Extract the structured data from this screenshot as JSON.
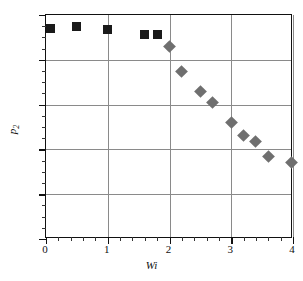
{
  "chart_data": {
    "type": "scatter",
    "title": "",
    "xlabel": "Wi",
    "ylabel": "p2",
    "ylabel_base": "p",
    "ylabel_sub": "2",
    "xlim": [
      0,
      4
    ],
    "ylim": [
      0,
      1.0
    ],
    "xticks": [
      0,
      1,
      2,
      3,
      4
    ],
    "xtick_labels": [
      "0",
      "1",
      "2",
      "3",
      "4"
    ],
    "yticks": [
      0,
      0.2,
      0.4,
      0.6,
      0.8,
      1.0
    ],
    "ytick_labels": [
      "0",
      "0.2",
      "0.4",
      "0.6",
      "0.8",
      "1.0"
    ],
    "x_minor_interval": 0.2,
    "y_minor_interval": 0.05,
    "grid": "horizontal-and-vertical-major",
    "grid_color": "#8a8a8a",
    "frame_color": "#111111",
    "background": "#ffffff",
    "legend": "none",
    "series": [
      {
        "name": "squares",
        "marker": "square",
        "color": "#1a1a1a",
        "points": [
          {
            "x": 0.08,
            "y": 0.94
          },
          {
            "x": 0.5,
            "y": 0.95
          },
          {
            "x": 1.0,
            "y": 0.935
          },
          {
            "x": 1.6,
            "y": 0.915
          },
          {
            "x": 1.8,
            "y": 0.912
          }
        ]
      },
      {
        "name": "diamonds",
        "marker": "diamond",
        "color": "#6f6f6f",
        "points": [
          {
            "x": 2.0,
            "y": 0.86
          },
          {
            "x": 2.2,
            "y": 0.75
          },
          {
            "x": 2.5,
            "y": 0.66
          },
          {
            "x": 2.7,
            "y": 0.61
          },
          {
            "x": 3.0,
            "y": 0.52
          },
          {
            "x": 3.2,
            "y": 0.46
          },
          {
            "x": 3.4,
            "y": 0.435
          },
          {
            "x": 3.6,
            "y": 0.37
          },
          {
            "x": 3.97,
            "y": 0.34
          }
        ]
      }
    ]
  }
}
